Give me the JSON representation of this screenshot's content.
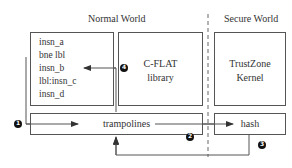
{
  "regions": {
    "normal_world": "Normal World",
    "secure_world": "Secure World"
  },
  "boxes": {
    "code": {
      "lines": [
        "insn_a",
        "bne lbl",
        "insn_b",
        "lbl:insn_c",
        "insn_d"
      ]
    },
    "cflat": {
      "line1": "C-FLAT",
      "line2": "library"
    },
    "trustzone": {
      "line1": "TrustZone",
      "line2": "Kernel"
    },
    "trampolines": {
      "label": "trampolines"
    },
    "hash": {
      "label": "hash"
    }
  },
  "steps": [
    {
      "id": "step-1",
      "label": "1"
    },
    {
      "id": "step-2",
      "label": "2"
    },
    {
      "id": "step-3",
      "label": "3"
    },
    {
      "id": "step-4",
      "label": "4"
    }
  ],
  "colors": {
    "line": "#555555",
    "text": "#333333",
    "marker": "#111111"
  }
}
